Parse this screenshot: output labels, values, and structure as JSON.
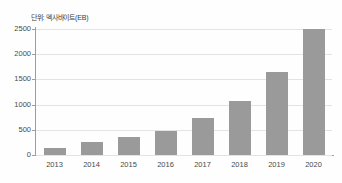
{
  "caption": {
    "unit_label": "단위: 엑사바이트(EB)"
  },
  "colors": {
    "bar": "#9a9a9a",
    "gridline": "#e3e3e3",
    "axis": "#9d9d9d",
    "background": "#ffffff",
    "text": "#4a4a4a"
  },
  "chart_data": {
    "type": "bar",
    "title": "",
    "subtitle": "",
    "xlabel": "",
    "ylabel": "단위: 엑사바이트(EB)",
    "categories": [
      "2013",
      "2014",
      "2015",
      "2016",
      "2017",
      "2018",
      "2019",
      "2020"
    ],
    "values": [
      145,
      250,
      350,
      480,
      730,
      1080,
      1650,
      2500
    ],
    "series": [
      {
        "name": "데이터량",
        "values": [
          145,
          250,
          350,
          480,
          730,
          1080,
          1650,
          2500
        ]
      }
    ],
    "ylim": [
      0,
      2500
    ],
    "ytick_labels": [
      "0",
      "500",
      "1000",
      "1500",
      "2000",
      "2500"
    ],
    "ytick_values": [
      0,
      500,
      1000,
      1500,
      2000,
      2500
    ],
    "grid": true,
    "legend": false,
    "legend_position": "none"
  }
}
